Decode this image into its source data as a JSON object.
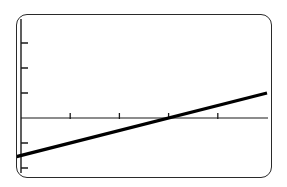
{
  "device": {
    "kind": "graphing-calculator-screen",
    "frame_color": "#2a2a2a",
    "screen_background": "#ffffff"
  },
  "chart_data": {
    "type": "line",
    "title": "",
    "subtitle": "",
    "xlabel": "",
    "ylabel": "",
    "series": [
      {
        "name": "y = 0.5x - 1.5",
        "slope": 0.5,
        "intercept": -1.5,
        "color": "#000000",
        "line_width_px": 3.2,
        "x": [
          -4,
          5
        ],
        "values": [
          -3.5,
          1
        ]
      }
    ],
    "xlim": [
      -4,
      5
    ],
    "ylim": [
      -4,
      4
    ],
    "x_tick_step": 1,
    "y_tick_step": 1,
    "x_ticks": [
      -3,
      -2,
      -1,
      0,
      1,
      2,
      3,
      4
    ],
    "y_ticks": [
      -3,
      -2,
      -1,
      0,
      1,
      2,
      3
    ],
    "x_tick_labels": [
      "",
      "",
      "",
      "",
      "",
      "",
      "",
      ""
    ],
    "y_tick_labels": [
      "",
      "",
      "",
      "",
      "",
      "",
      ""
    ],
    "grid": false,
    "legend": false,
    "legend_position": "none",
    "axis_color": "#1a1a1a",
    "tick_color": "#1a1a1a",
    "annotations": []
  },
  "geometry": {
    "origin_x_px": 4,
    "origin_y_px": 103,
    "x_unit_px": 49.2,
    "y_unit_px": 25.0,
    "line_start_px": [
      5,
      142
    ],
    "line_end_px": [
      251,
      22
    ],
    "x_axis_y_px": 103,
    "y_axis_x_px": 4,
    "x_tick_half_px": 5,
    "y_tick_len_px": 7
  }
}
